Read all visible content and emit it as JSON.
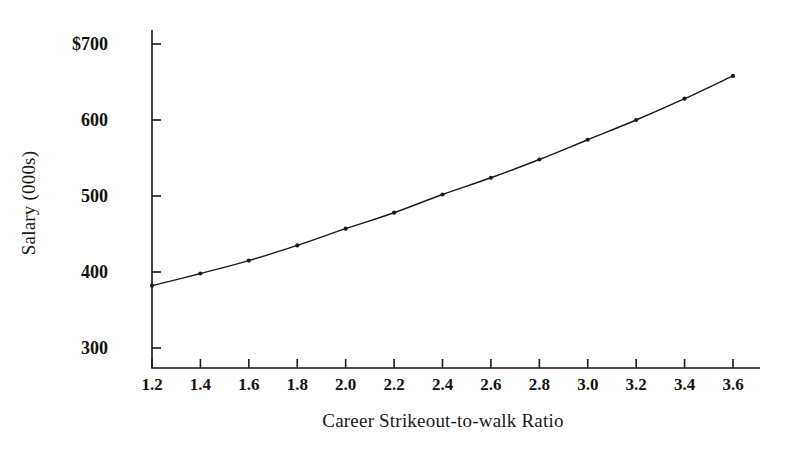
{
  "chart_data": {
    "type": "line",
    "title": "",
    "subtitle": "",
    "xlabel": "Career Strikeout-to-walk Ratio",
    "ylabel": "Salary (000s)",
    "x": [
      1.2,
      1.4,
      1.6,
      1.8,
      2.0,
      2.2,
      2.4,
      2.6,
      2.8,
      3.0,
      3.2,
      3.4,
      3.6
    ],
    "values": [
      382,
      398,
      415,
      435,
      457,
      478,
      502,
      524,
      548,
      574,
      600,
      628,
      658
    ],
    "series": [
      {
        "name": "Predicted Salary",
        "values": [
          382,
          398,
          415,
          435,
          457,
          478,
          502,
          524,
          548,
          574,
          600,
          628,
          658
        ]
      }
    ],
    "xtick_labels": [
      "1.2",
      "1.4",
      "1.6",
      "1.8",
      "2.0",
      "2.2",
      "2.4",
      "2.6",
      "2.8",
      "3.0",
      "3.2",
      "3.4",
      "3.6"
    ],
    "xtick_values": [
      1.2,
      1.4,
      1.6,
      1.8,
      2.0,
      2.2,
      2.4,
      2.6,
      2.8,
      3.0,
      3.2,
      3.4,
      3.6
    ],
    "ytick_labels": [
      "$700",
      "600",
      "500",
      "400",
      "300"
    ],
    "ytick_values": [
      700,
      600,
      500,
      400,
      300
    ],
    "xlim": [
      1.2,
      3.6
    ],
    "ylim": [
      300,
      700
    ],
    "grid": false,
    "legend": false,
    "legend_position": "none",
    "marker": "dot",
    "line_color": "#1a1a1a",
    "marker_color": "#1a1a1a",
    "background_color": "#ffffff",
    "axis_color": "#1a1a1a",
    "annotations": []
  },
  "axes": {
    "y_title": "Salary (000s)",
    "x_title": "Career Strikeout-to-walk Ratio"
  }
}
